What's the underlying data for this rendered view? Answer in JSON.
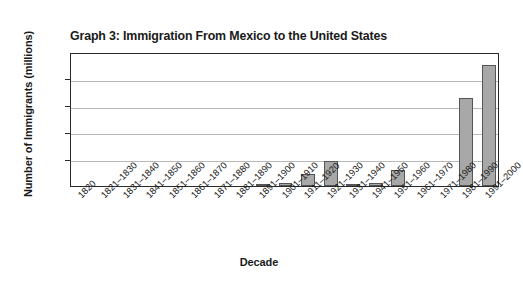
{
  "chart_data": {
    "type": "bar",
    "title": "Graph 3: Immigration From Mexico to the United States",
    "xlabel": "Decade",
    "ylabel": "Number of Immigrants (millions)",
    "ylim": [
      0,
      2.5
    ],
    "yticks": [
      "0",
      "0.5",
      "1",
      "1.5",
      "2",
      "2.5"
    ],
    "ytick_values": [
      0,
      0.5,
      1,
      1.5,
      2,
      2.5
    ],
    "grid": true,
    "legend": "none",
    "bar_color": "#a8a8a8",
    "bar_edge_color": "#555555",
    "categories": [
      "1820",
      "1821–1830",
      "1831–1840",
      "1841–1850",
      "1851–1860",
      "1861–1870",
      "1871–1880",
      "1881–1890",
      "1891–1900",
      "1901–1910",
      "1911–1920",
      "1921–1930",
      "1931–1940",
      "1941–1950",
      "1951–1960",
      "1961–1970",
      "1971–1980",
      "1981–1990",
      "1991–2000"
    ],
    "values": [
      0,
      0,
      0,
      0,
      0,
      0,
      0,
      0,
      0.01,
      0.05,
      0.22,
      0.46,
      0.01,
      0.06,
      0.3,
      0,
      0,
      1.65,
      2.25
    ]
  }
}
